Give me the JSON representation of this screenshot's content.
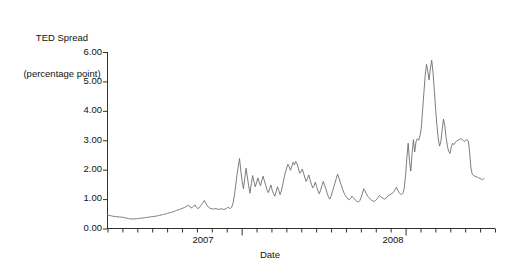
{
  "chart_data": {
    "type": "line",
    "title": "TED Spread\n(percentage point)",
    "title_lines": [
      "TED Spread",
      "(percentage point)"
    ],
    "xlabel": "Date",
    "ylabel": "TED Spread (percentage point)",
    "ylim": [
      0,
      6
    ],
    "y_ticks": [
      0,
      1,
      2,
      3,
      4,
      5,
      6
    ],
    "y_tick_labels": [
      "0.00",
      "1.00",
      "2.00",
      "3.00",
      "4.00",
      "5.00",
      "6.00"
    ],
    "x_tick_labels": [
      "2007",
      "2008"
    ],
    "x_tick_positions_frac": [
      0.333,
      0.762
    ],
    "x_minor_tick_count": 26,
    "xlim_description": "monthly ticks spanning roughly mid-2006 through late 2008",
    "grid": false,
    "legend": null,
    "line_color": "#6e6e6e",
    "line_width": 0.9,
    "axis_color": "#333333",
    "background": "#ffffff",
    "series": [
      {
        "name": "TED Spread",
        "units": "percentage point",
        "values": [
          0.46,
          0.45,
          0.44,
          0.43,
          0.42,
          0.41,
          0.41,
          0.4,
          0.4,
          0.39,
          0.39,
          0.38,
          0.38,
          0.37,
          0.36,
          0.35,
          0.34,
          0.33,
          0.33,
          0.32,
          0.32,
          0.33,
          0.33,
          0.34,
          0.34,
          0.35,
          0.35,
          0.36,
          0.36,
          0.37,
          0.38,
          0.38,
          0.39,
          0.4,
          0.4,
          0.41,
          0.41,
          0.42,
          0.43,
          0.44,
          0.45,
          0.46,
          0.47,
          0.48,
          0.49,
          0.5,
          0.52,
          0.53,
          0.54,
          0.55,
          0.56,
          0.58,
          0.6,
          0.62,
          0.63,
          0.65,
          0.66,
          0.68,
          0.7,
          0.72,
          0.74,
          0.77,
          0.8,
          0.74,
          0.7,
          0.72,
          0.76,
          0.8,
          0.72,
          0.68,
          0.7,
          0.76,
          0.82,
          0.88,
          0.95,
          0.88,
          0.8,
          0.74,
          0.7,
          0.68,
          0.67,
          0.66,
          0.67,
          0.68,
          0.66,
          0.65,
          0.66,
          0.67,
          0.66,
          0.65,
          0.66,
          0.68,
          0.72,
          0.7,
          0.68,
          0.72,
          0.86,
          1.1,
          1.45,
          1.8,
          2.1,
          2.38,
          1.95,
          1.6,
          1.35,
          1.7,
          2.05,
          1.75,
          1.45,
          1.2,
          1.52,
          1.8,
          1.6,
          1.42,
          1.55,
          1.72,
          1.58,
          1.45,
          1.62,
          1.78,
          1.62,
          1.48,
          1.32,
          1.22,
          1.35,
          1.48,
          1.3,
          1.18,
          1.1,
          1.25,
          1.42,
          1.3,
          1.15,
          1.28,
          1.48,
          1.7,
          1.9,
          2.05,
          2.18,
          2.1,
          1.98,
          2.12,
          2.25,
          2.16,
          2.28,
          2.2,
          2.05,
          1.88,
          1.92,
          2.02,
          1.88,
          1.72,
          1.6,
          1.7,
          1.82,
          1.65,
          1.5,
          1.38,
          1.45,
          1.58,
          1.42,
          1.28,
          1.18,
          1.3,
          1.45,
          1.6,
          1.48,
          1.35,
          1.2,
          1.08,
          1.0,
          1.1,
          1.25,
          1.4,
          1.55,
          1.7,
          1.85,
          1.72,
          1.58,
          1.45,
          1.32,
          1.2,
          1.12,
          1.05,
          1.0,
          0.98,
          1.02,
          1.1,
          1.05,
          1.0,
          0.95,
          0.92,
          0.9,
          0.95,
          1.05,
          1.2,
          1.35,
          1.28,
          1.18,
          1.1,
          1.05,
          1.0,
          0.96,
          0.94,
          0.92,
          0.95,
          1.0,
          1.05,
          1.12,
          1.08,
          1.05,
          1.02,
          1.0,
          1.02,
          1.08,
          1.12,
          1.15,
          1.18,
          1.2,
          1.25,
          1.32,
          1.4,
          1.3,
          1.22,
          1.18,
          1.15,
          1.2,
          1.38,
          1.8,
          2.4,
          2.9,
          2.3,
          1.95,
          2.55,
          3.02,
          2.6,
          2.95,
          3.05,
          3.0,
          3.15,
          3.4,
          4.0,
          4.6,
          5.2,
          5.58,
          5.35,
          5.05,
          5.45,
          5.72,
          5.3,
          4.7,
          4.05,
          3.5,
          3.05,
          2.8,
          2.95,
          3.35,
          3.72,
          3.5,
          3.1,
          2.8,
          2.62,
          2.55,
          2.78,
          2.9,
          2.85,
          2.92,
          2.98,
          3.0,
          3.02,
          3.05,
          3.04,
          3.0,
          2.95,
          3.0,
          3.02,
          2.98,
          2.6,
          2.05,
          1.85,
          1.8,
          1.78,
          1.76,
          1.74,
          1.72,
          1.7,
          1.68,
          1.66,
          1.7
        ]
      }
    ]
  },
  "figure": {
    "title_line_1": "TED Spread",
    "title_line_2": "(percentage point)",
    "x_axis_label": "Date",
    "y_tick_0": "0.00",
    "y_tick_1": "1.00",
    "y_tick_2": "2.00",
    "y_tick_3": "3.00",
    "y_tick_4": "4.00",
    "y_tick_5": "5.00",
    "y_tick_6": "6.00",
    "x_tick_a": "2007",
    "x_tick_b": "2008"
  }
}
